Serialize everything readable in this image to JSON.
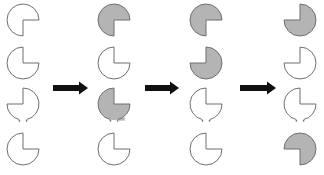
{
  "colors": {
    "stroke": "#6f6f6f",
    "fill_gray": "#b4b4b4",
    "fill_white": "#ffffff",
    "arrow": "#111111"
  },
  "radius": 16,
  "columns": [
    {
      "cx": 23,
      "shapes": [
        {
          "cy": 20,
          "missing": "BR",
          "fill": "white",
          "open": false
        },
        {
          "cy": 63,
          "missing": "TR",
          "fill": "white",
          "open": false
        },
        {
          "cy": 104,
          "missing": "TL",
          "fill": "white",
          "open": true
        },
        {
          "cy": 149,
          "missing": "TR",
          "fill": "white",
          "open": false
        }
      ]
    },
    {
      "cx": 114,
      "shapes": [
        {
          "cy": 20,
          "missing": "BR",
          "fill": "gray",
          "open": false
        },
        {
          "cy": 63,
          "missing": "TR",
          "fill": "white",
          "open": false
        },
        {
          "cy": 104,
          "missing": "TR",
          "fill": "gray",
          "open": true
        },
        {
          "cy": 149,
          "missing": "TR",
          "fill": "white",
          "open": false
        }
      ]
    },
    {
      "cx": 206,
      "shapes": [
        {
          "cy": 20,
          "missing": "BR",
          "fill": "gray",
          "open": false
        },
        {
          "cy": 63,
          "missing": "TL",
          "fill": "gray",
          "open": false
        },
        {
          "cy": 104,
          "missing": "TR",
          "fill": "white",
          "open": true
        },
        {
          "cy": 149,
          "missing": "TR",
          "fill": "white",
          "open": false
        }
      ]
    },
    {
      "cx": 300,
      "shapes": [
        {
          "cy": 20,
          "missing": "TL",
          "fill": "gray",
          "open": false
        },
        {
          "cy": 63,
          "missing": "TL",
          "fill": "white",
          "open": false
        },
        {
          "cy": 104,
          "missing": "TR",
          "fill": "white",
          "open": true
        },
        {
          "cy": 149,
          "missing": "BL",
          "fill": "gray",
          "open": false
        }
      ]
    }
  ],
  "arrows": [
    {
      "x1": 53,
      "x2": 88,
      "cy": 88
    },
    {
      "x1": 145,
      "x2": 179,
      "cy": 88
    },
    {
      "x1": 240,
      "x2": 276,
      "cy": 88
    }
  ]
}
